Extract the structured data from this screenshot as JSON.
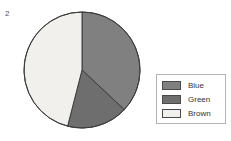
{
  "figure": {
    "corner_label": "2"
  },
  "chart_data": {
    "type": "pie",
    "title": "",
    "labels": [
      "Blue",
      "Green",
      "Brown"
    ],
    "values": [
      37,
      17,
      46
    ],
    "units": "percent",
    "colors": [
      "#808080",
      "#6e6e6e",
      "#f2f0ec"
    ],
    "edge_color": "#3c3c3c",
    "start_angle_deg": 90,
    "direction": "clockwise",
    "legend": {
      "position": "right",
      "border_color": "#b4b4b4",
      "background": "#ffffff",
      "entries": [
        {
          "label": "Blue",
          "color": "#808080"
        },
        {
          "label": "Green",
          "color": "#6e6e6e"
        },
        {
          "label": "Brown",
          "color": "#f2f0ec"
        }
      ]
    },
    "geometry": {
      "center_x": 82,
      "center_y": 70,
      "radius": 58
    }
  }
}
